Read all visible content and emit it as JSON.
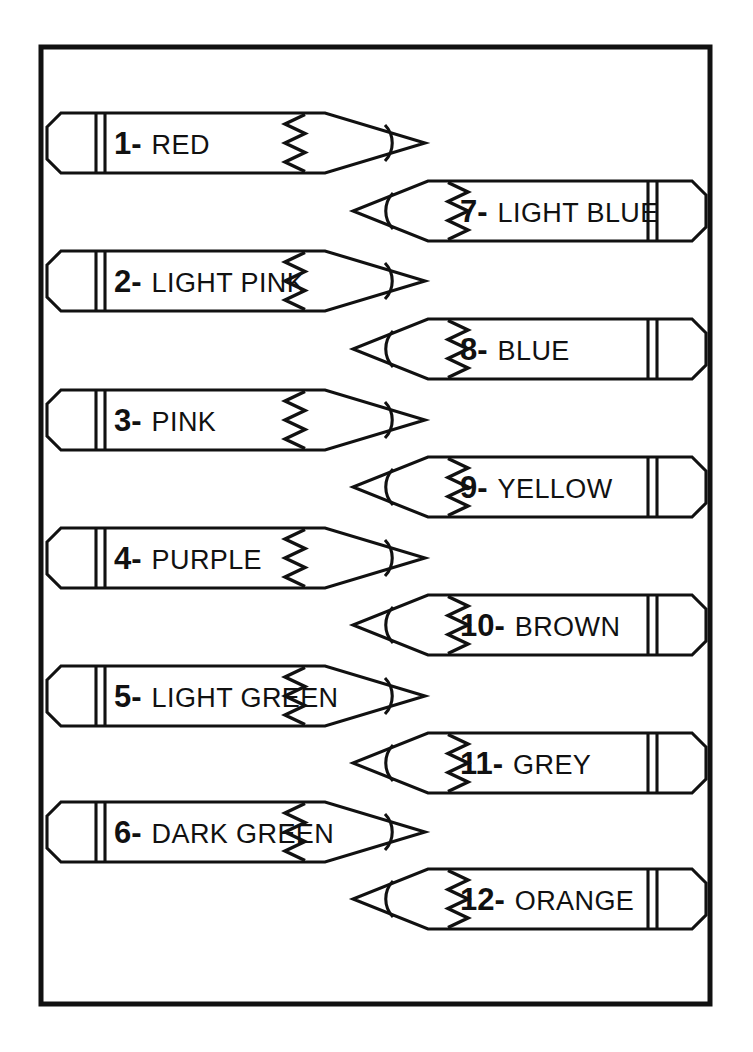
{
  "page": {
    "background_color": "#ffffff",
    "ink_color": "#111111",
    "frame": {
      "x": 41,
      "y": 47,
      "width": 669,
      "height": 957,
      "stroke_width": 5
    }
  },
  "legend": {
    "separator": "-"
  },
  "pencils": [
    {
      "number": "1",
      "separator": "-",
      "label": "RED",
      "direction": "right",
      "eraser_x": 47,
      "tip_x": 425,
      "top_y": 113,
      "bottom_y": 173
    },
    {
      "number": "2",
      "separator": "-",
      "label": "LIGHT PINK",
      "direction": "right",
      "eraser_x": 47,
      "tip_x": 425,
      "top_y": 251,
      "bottom_y": 311
    },
    {
      "number": "3",
      "separator": "-",
      "label": "PINK",
      "direction": "right",
      "eraser_x": 47,
      "tip_x": 425,
      "top_y": 390,
      "bottom_y": 450
    },
    {
      "number": "4",
      "separator": "-",
      "label": "PURPLE",
      "direction": "right",
      "eraser_x": 47,
      "tip_x": 425,
      "top_y": 528,
      "bottom_y": 588
    },
    {
      "number": "5",
      "separator": "-",
      "label": "LIGHT GREEN",
      "direction": "right",
      "eraser_x": 47,
      "tip_x": 425,
      "top_y": 666,
      "bottom_y": 726
    },
    {
      "number": "6",
      "separator": "-",
      "label": "DARK GREEN",
      "direction": "right",
      "eraser_x": 47,
      "tip_x": 425,
      "top_y": 802,
      "bottom_y": 862
    },
    {
      "number": "7",
      "separator": "-",
      "label": "LIGHT BLUE",
      "direction": "left",
      "eraser_x": 706,
      "tip_x": 353,
      "top_y": 181,
      "bottom_y": 241
    },
    {
      "number": "8",
      "separator": "-",
      "label": "BLUE",
      "direction": "left",
      "eraser_x": 706,
      "tip_x": 353,
      "top_y": 319,
      "bottom_y": 379
    },
    {
      "number": "9",
      "separator": "-",
      "label": "YELLOW",
      "direction": "left",
      "eraser_x": 706,
      "tip_x": 353,
      "top_y": 457,
      "bottom_y": 517
    },
    {
      "number": "10",
      "separator": "-",
      "label": "BROWN",
      "direction": "left",
      "eraser_x": 706,
      "tip_x": 353,
      "top_y": 595,
      "bottom_y": 655
    },
    {
      "number": "11",
      "separator": "-",
      "label": "GREY",
      "direction": "left",
      "eraser_x": 706,
      "tip_x": 353,
      "top_y": 733,
      "bottom_y": 793
    },
    {
      "number": "12",
      "separator": "-",
      "label": "ORANGE",
      "direction": "left",
      "eraser_x": 706,
      "tip_x": 353,
      "top_y": 869,
      "bottom_y": 929
    }
  ]
}
